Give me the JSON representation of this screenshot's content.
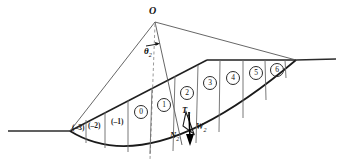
{
  "figure": {
    "background_color": "#ffffff",
    "line_color": "#3a3a3a",
    "heavy_line_color": "#1a1a1a",
    "dashed_line_color": "#8a8a8a",
    "apex_label": "O",
    "angle_label": "θ",
    "angle_subscript": "2"
  },
  "slices": {
    "left_labels": [
      {
        "id": "slice-neg3",
        "text": "(–3)",
        "x": 76,
        "y": 128
      },
      {
        "id": "slice-neg2",
        "text": "(–2)",
        "x": 94,
        "y": 126
      },
      {
        "id": "slice-neg1",
        "text": "(–1)",
        "x": 117,
        "y": 122
      },
      {
        "id": "slice-0",
        "text": "0",
        "x": 141,
        "y": 110
      },
      {
        "id": "slice-1",
        "text": "1",
        "x": 164,
        "y": 103
      }
    ],
    "circled_labels": [
      {
        "id": "slice-0",
        "text": "0",
        "x": 140,
        "y": 109
      },
      {
        "id": "slice-1",
        "text": "1",
        "x": 163,
        "y": 102
      },
      {
        "id": "slice-2",
        "text": "2",
        "x": 186,
        "y": 90
      },
      {
        "id": "slice-3",
        "text": "3",
        "x": 208,
        "y": 80
      },
      {
        "id": "slice-4",
        "text": "4",
        "x": 231,
        "y": 75
      },
      {
        "id": "slice-5",
        "text": "5",
        "x": 254,
        "y": 70
      },
      {
        "id": "slice-6",
        "text": "6",
        "x": 275,
        "y": 66
      }
    ]
  },
  "forces": {
    "tension_label": "T",
    "tension_sub": "2",
    "weight_label": "W",
    "weight_sub": "2",
    "normal_label": "N",
    "normal_sub": "2"
  },
  "geometry": {
    "apex": {
      "x": 155,
      "y": 22
    },
    "toe": {
      "x": 70,
      "y": 131
    },
    "crest": {
      "x": 207,
      "y": 60
    },
    "crest_right": {
      "x": 296,
      "y": 60
    },
    "arc_low_point": {
      "x": 150,
      "y": 152
    }
  }
}
